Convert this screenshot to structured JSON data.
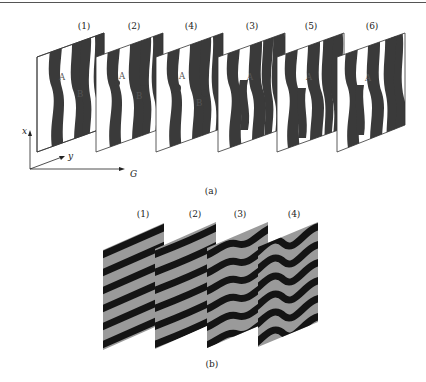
{
  "figure": {
    "subfigure_a": {
      "caption": "(a)",
      "panels": [
        {
          "label": "(1)",
          "markers": [
            "A",
            "B"
          ]
        },
        {
          "label": "(2)",
          "markers": [
            "A",
            "B"
          ]
        },
        {
          "label": "(4)",
          "markers": [
            "A",
            "B"
          ]
        },
        {
          "label": "(3)",
          "markers": [
            "A"
          ]
        },
        {
          "label": "(5)",
          "markers": [
            "A"
          ]
        },
        {
          "label": "(6)",
          "markers": [
            "A"
          ]
        }
      ],
      "axes": {
        "x": "x",
        "y": "y",
        "g": "G"
      },
      "colors": {
        "stripe": "#3a3a3a",
        "background": "#ffffff",
        "border": "#333333"
      }
    },
    "subfigure_b": {
      "caption": "(b)",
      "panels": [
        {
          "label": "(1)"
        },
        {
          "label": "(2)"
        },
        {
          "label": "(3)"
        },
        {
          "label": "(4)"
        }
      ],
      "colors": {
        "dark_band": "#1a1a1a",
        "light_band": "#9a9a9a"
      }
    }
  }
}
